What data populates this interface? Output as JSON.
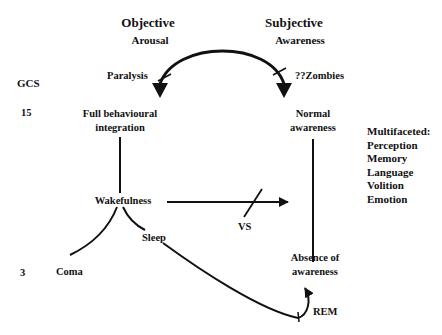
{
  "diagram": {
    "columns": {
      "objective": {
        "title": "Objective",
        "subtitle": "Arousal"
      },
      "subjective": {
        "title": "Subjective",
        "subtitle": "Awareness"
      }
    },
    "arc": {
      "left_label": "Paralysis",
      "right_label": "??Zombies",
      "left_blocked": true,
      "right_blocked": true
    },
    "gcs_scale": {
      "label": "GCS",
      "high": "15",
      "low": "3"
    },
    "nodes": {
      "full_integration": "Full behavioural integration",
      "full_integration_line1": "Full behavioural",
      "full_integration_line2": "integration",
      "normal_awareness_line1": "Normal",
      "normal_awareness_line2": "awareness",
      "wakefulness": "Wakefulness",
      "sleep": "Sleep",
      "coma": "Coma",
      "absence_line1": "Absence of",
      "absence_line2": "awareness",
      "rem": "REM"
    },
    "transition": {
      "label": "VS",
      "blocked": true
    },
    "aspects": {
      "heading": "Multifaceted:",
      "items": [
        "Perception",
        "Memory",
        "Language",
        "Volition",
        "Emotion"
      ]
    }
  }
}
